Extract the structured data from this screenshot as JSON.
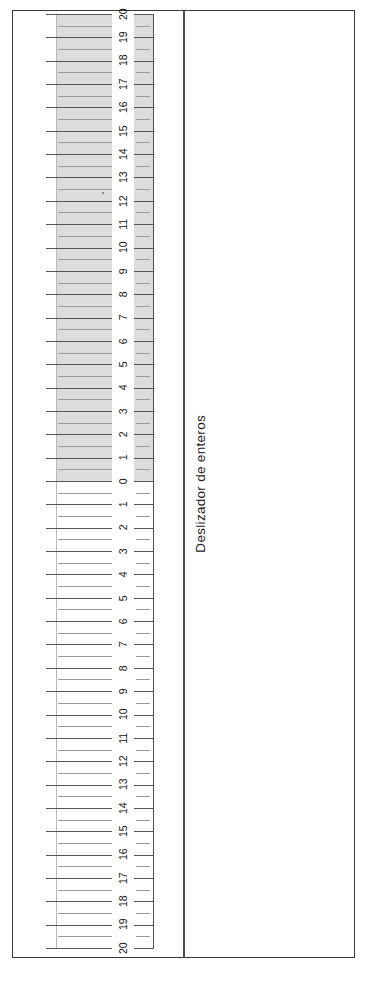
{
  "widget": {
    "caption": "Deslizador de enteros",
    "type": "integer-slider-ruler"
  },
  "colors": {
    "frame_border": "#3a3a3a",
    "divider": "#4a4a4a",
    "fill_shade": "#dcdcdc",
    "tick_major": "#555555",
    "tick_minor": "#9a9a9a",
    "numeral": "#111111",
    "background": "#ffffff"
  },
  "scale": {
    "top_value": 20,
    "zero_value": 0,
    "bottom_value": 20,
    "total_units": 40,
    "minor_per_major": 2,
    "orientation": "vertical",
    "numerals_upper": [
      "20",
      "19",
      "18",
      "17",
      "16",
      "15",
      "14",
      "13",
      "12",
      "11",
      "10",
      "9",
      "8",
      "7",
      "6",
      "5",
      "4",
      "3",
      "2",
      "1",
      "0"
    ],
    "numerals_lower": [
      "1",
      "2",
      "3",
      "4",
      "5",
      "6",
      "7",
      "8",
      "9",
      "10",
      "11",
      "12",
      "13",
      "14",
      "15",
      "16",
      "17",
      "18",
      "19",
      "20"
    ],
    "filled_from": 0,
    "filled_to": 20,
    "filled_side": "upper"
  },
  "chart_data": {
    "type": "table",
    "title": "Deslizador de enteros",
    "ylabel": "",
    "xlabel": "",
    "ylim": [
      20,
      -20
    ],
    "categories": [
      "20",
      "19",
      "18",
      "17",
      "16",
      "15",
      "14",
      "13",
      "12",
      "11",
      "10",
      "9",
      "8",
      "7",
      "6",
      "5",
      "4",
      "3",
      "2",
      "1",
      "0",
      "1",
      "2",
      "3",
      "4",
      "5",
      "6",
      "7",
      "8",
      "9",
      "10",
      "11",
      "12",
      "13",
      "14",
      "15",
      "16",
      "17",
      "18",
      "19",
      "20"
    ],
    "values": [
      20,
      19,
      18,
      17,
      16,
      15,
      14,
      13,
      12,
      11,
      10,
      9,
      8,
      7,
      6,
      5,
      4,
      3,
      2,
      1,
      0,
      -1,
      -2,
      -3,
      -4,
      -5,
      -6,
      -7,
      -8,
      -9,
      -10,
      -11,
      -12,
      -13,
      -14,
      -15,
      -16,
      -17,
      -18,
      -19,
      -20
    ],
    "grid": true,
    "legend": "none"
  }
}
